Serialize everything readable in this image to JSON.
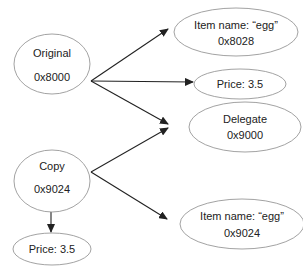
{
  "diagram": {
    "type": "object-reference-graph",
    "nodes": [
      {
        "id": "original",
        "lines": [
          "Original",
          "0x8000"
        ],
        "cx": 52,
        "cy": 64,
        "rx": 38,
        "ry": 30,
        "line_y": [
          57,
          81
        ]
      },
      {
        "id": "item_egg_8028",
        "lines": [
          "Item name: “egg”",
          "0x8028"
        ],
        "cx": 236,
        "cy": 32,
        "rx": 62,
        "ry": 24,
        "line_y": [
          29,
          45
        ]
      },
      {
        "id": "price_top",
        "lines": [
          "Price: 3.5"
        ],
        "cx": 240,
        "cy": 84,
        "rx": 46,
        "ry": 15,
        "line_y": [
          88
        ]
      },
      {
        "id": "delegate",
        "lines": [
          "Delegate",
          "0x9000"
        ],
        "cx": 245,
        "cy": 127,
        "rx": 56,
        "ry": 25,
        "line_y": [
          123,
          139
        ]
      },
      {
        "id": "copy",
        "lines": [
          "Copy",
          "0x9024"
        ],
        "cx": 52,
        "cy": 181,
        "rx": 38,
        "ry": 31,
        "line_y": [
          170,
          193
        ]
      },
      {
        "id": "price_bottom",
        "lines": [
          "Price: 3.5"
        ],
        "cx": 52,
        "cy": 249,
        "rx": 39,
        "ry": 16,
        "line_y": [
          253
        ]
      },
      {
        "id": "item_egg_9024",
        "lines": [
          "Item name: “egg”",
          "0x9024"
        ],
        "cx": 242,
        "cy": 224,
        "rx": 62,
        "ry": 25,
        "line_y": [
          220,
          237
        ]
      }
    ],
    "edges": [
      {
        "from": "original",
        "to": "item_egg_8028",
        "x1": 91,
        "y1": 81,
        "x2": 168,
        "y2": 29
      },
      {
        "from": "original",
        "to": "price_top",
        "x1": 91,
        "y1": 81,
        "x2": 193,
        "y2": 82
      },
      {
        "from": "original",
        "to": "delegate",
        "x1": 91,
        "y1": 81,
        "x2": 168,
        "y2": 124
      },
      {
        "from": "copy",
        "to": "delegate",
        "x1": 91,
        "y1": 172,
        "x2": 168,
        "y2": 128
      },
      {
        "from": "copy",
        "to": "item_egg_9024",
        "x1": 91,
        "y1": 172,
        "x2": 167,
        "y2": 219
      },
      {
        "from": "copy",
        "to": "price_bottom",
        "x1": 51,
        "y1": 212,
        "x2": 51,
        "y2": 232
      }
    ],
    "colors": {
      "node_stroke": "#8a8a8a",
      "edge": "#222222",
      "text": "#222222",
      "background": "#ffffff"
    }
  }
}
